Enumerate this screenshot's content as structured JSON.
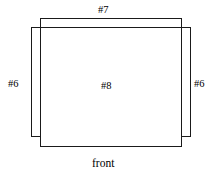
{
  "diagram": {
    "title": "front",
    "orientation_label": "front",
    "line_color": "#1a1a1a",
    "fill_color": "#ffffff",
    "panels": [
      {
        "id": "top-panel",
        "label": "#7",
        "role": "top",
        "x": 40,
        "y": 18,
        "width": 141,
        "height": 110
      },
      {
        "id": "left-side-panel",
        "label": "#6",
        "role": "left-side",
        "x": 31,
        "y": 27,
        "width": 150,
        "height": 109
      },
      {
        "id": "right-side-panel",
        "label": "#6",
        "role": "right-side",
        "x": 40,
        "y": 27,
        "width": 150,
        "height": 109
      },
      {
        "id": "front-panel",
        "label": "#8",
        "role": "front",
        "x": 40,
        "y": 27,
        "width": 141,
        "height": 119
      }
    ],
    "labels": {
      "top": "#7",
      "left": "#6",
      "right": "#6",
      "center": "#8",
      "bottom": "front"
    }
  }
}
